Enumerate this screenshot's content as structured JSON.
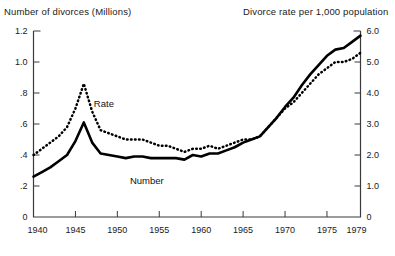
{
  "header": {
    "left_title": "Number of divorces (Millions)",
    "right_title": "Divorce rate per 1,000 population"
  },
  "labels": {
    "rate": "Rate",
    "number": "Number"
  },
  "chart_data": {
    "type": "line",
    "title": "",
    "subtitle": "",
    "xlabel": "",
    "ylabel": "Number of divorces (Millions)",
    "y2label": "Divorce rate per 1,000 population",
    "grid": false,
    "legend": "inline-annotations",
    "xlim": [
      1940,
      1979
    ],
    "xticks": [
      1940,
      1945,
      1950,
      1955,
      1960,
      1965,
      1970,
      1975,
      1979
    ],
    "xticklabels": [
      "1940",
      "1945",
      "1950",
      "1955",
      "1960",
      "1965",
      "1970",
      "1975",
      "1979"
    ],
    "ylim": [
      0,
      1.2
    ],
    "yticks": [
      0,
      0.2,
      0.4,
      0.6,
      0.8,
      1.0,
      1.2
    ],
    "yticklabels": [
      "0",
      ".2",
      ".4",
      ".6",
      ".8",
      "1.0",
      "1.2"
    ],
    "y2lim": [
      0,
      6.0
    ],
    "y2ticks": [
      0,
      1.0,
      2.0,
      3.0,
      4.0,
      5.0,
      6.0
    ],
    "y2ticklabels": [
      "0",
      "1.0",
      "2.0",
      "3.0",
      "4.0",
      "5.0",
      "6.0"
    ],
    "x": [
      1940,
      1941,
      1942,
      1943,
      1944,
      1945,
      1946,
      1947,
      1948,
      1949,
      1950,
      1951,
      1952,
      1953,
      1954,
      1955,
      1956,
      1957,
      1958,
      1959,
      1960,
      1961,
      1962,
      1963,
      1964,
      1965,
      1966,
      1967,
      1968,
      1969,
      1970,
      1971,
      1972,
      1973,
      1974,
      1975,
      1976,
      1977,
      1978,
      1979
    ],
    "series": [
      {
        "name": "Number",
        "axis": "left",
        "style": "solid",
        "units": "millions",
        "values": [
          0.26,
          0.29,
          0.32,
          0.36,
          0.4,
          0.49,
          0.61,
          0.48,
          0.41,
          0.4,
          0.39,
          0.38,
          0.39,
          0.39,
          0.38,
          0.38,
          0.38,
          0.38,
          0.37,
          0.4,
          0.39,
          0.41,
          0.41,
          0.43,
          0.45,
          0.48,
          0.5,
          0.52,
          0.58,
          0.64,
          0.71,
          0.77,
          0.85,
          0.92,
          0.98,
          1.04,
          1.08,
          1.09,
          1.13,
          1.17
        ]
      },
      {
        "name": "Rate",
        "axis": "right",
        "style": "dotted",
        "units": "per 1,000 population",
        "values": [
          2.0,
          2.2,
          2.4,
          2.6,
          2.9,
          3.5,
          4.3,
          3.4,
          2.8,
          2.7,
          2.6,
          2.5,
          2.5,
          2.5,
          2.4,
          2.3,
          2.3,
          2.2,
          2.1,
          2.2,
          2.2,
          2.3,
          2.2,
          2.3,
          2.4,
          2.5,
          2.5,
          2.6,
          2.9,
          3.2,
          3.5,
          3.7,
          4.0,
          4.3,
          4.6,
          4.8,
          5.0,
          5.0,
          5.1,
          5.3
        ]
      }
    ],
    "annotations": [
      {
        "text": "Rate",
        "x": 1947.2,
        "y2": 3.55
      },
      {
        "text": "Number",
        "x": 1951.5,
        "y": 0.21
      }
    ]
  }
}
